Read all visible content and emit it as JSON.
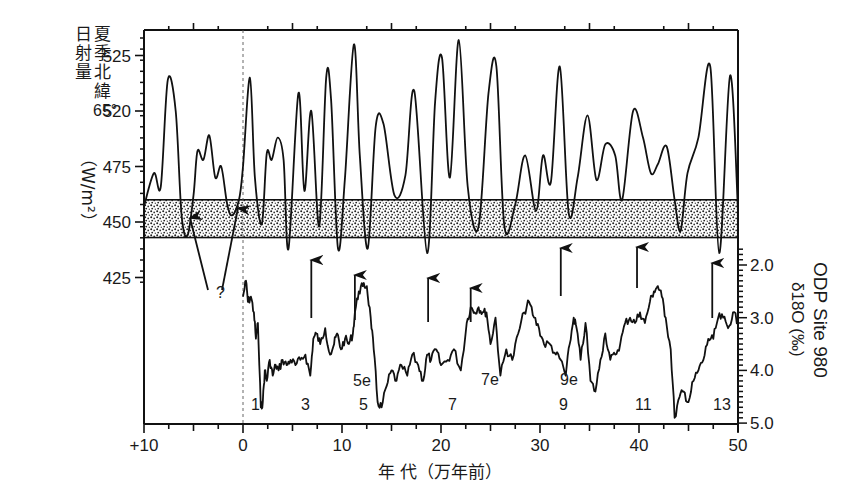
{
  "chart_data": {
    "type": "line",
    "title": "",
    "xlabel": "年 代（万年前）",
    "x_ticks": [
      "+10",
      "0",
      "10",
      "20",
      "30",
      "40",
      "50"
    ],
    "x_tick_values": [
      -10,
      0,
      10,
      20,
      30,
      40,
      50
    ],
    "xlim": [
      -10,
      50
    ],
    "x_reference_line": {
      "x": 0,
      "style": "dashed"
    },
    "top_panel": {
      "series_name": "夏季北緯65°日射量",
      "ylabel_lines": [
        "夏季北緯",
        "日射量",
        "65°",
        "（W/m²）"
      ],
      "y_tick_labels": [
        "525",
        "520",
        "475",
        "450",
        "425"
      ],
      "y_tick_positions": [
        525,
        500,
        475,
        450,
        425
      ],
      "ylim": [
        422,
        560
      ],
      "shaded_band": {
        "y_low": 443,
        "y_high": 460,
        "fill": "stippled"
      },
      "x": [
        -10,
        -9,
        -8.3,
        -7.6,
        -6.8,
        -6.2,
        -5.6,
        -5,
        -4.6,
        -4,
        -3.4,
        -2.8,
        -2.2,
        -1.6,
        -1.1,
        -0.4,
        0,
        0.7,
        1.2,
        1.9,
        2.4,
        2.9,
        3.5,
        4.1,
        4.6,
        5.6,
        6.2,
        6.9,
        7.7,
        8.4,
        8.9,
        9.6,
        10.3,
        11.2,
        11.8,
        12.6,
        13.4,
        14.2,
        15.3,
        16.4,
        17.3,
        18.6,
        19.4,
        20.1,
        20.9,
        21.8,
        22.7,
        23.8,
        24.8,
        25.6,
        26.4,
        27.5,
        28.5,
        29.6,
        30.3,
        31.1,
        32.0,
        32.9,
        33.8,
        34.8,
        35.7,
        36.6,
        37.6,
        38.3,
        39.4,
        40.4,
        41.2,
        41.9,
        42.8,
        43.6,
        44.2,
        44.9,
        46.0,
        47.2,
        48.1,
        49.2,
        50
      ],
      "values": [
        457,
        472,
        466,
        514,
        500,
        453,
        444,
        462,
        482,
        478,
        489,
        470,
        475,
        458,
        453,
        460,
        475,
        515,
        470,
        449,
        481,
        478,
        488,
        478,
        438,
        508,
        464,
        500,
        448,
        515,
        505,
        438,
        470,
        530,
        480,
        438,
        493,
        494,
        462,
        471,
        509,
        436,
        504,
        524,
        470,
        532,
        466,
        448,
        508,
        520,
        448,
        458,
        480,
        455,
        480,
        468,
        520,
        454,
        470,
        498,
        469,
        485,
        480,
        460,
        500,
        488,
        472,
        476,
        484,
        460,
        446,
        472,
        488,
        520,
        436,
        516,
        455
      ]
    },
    "bottom_panel": {
      "series_name": "ODP Site 980 δ18O (‰)",
      "ylabel_lines": [
        "ODP Site 980",
        "δ18O (‰)"
      ],
      "y_tick_labels": [
        "2.0",
        "3.0",
        "4.0",
        "5.0"
      ],
      "y_tick_values": [
        2.0,
        3.0,
        4.0,
        5.0
      ],
      "ylim": [
        1.7,
        5.0
      ],
      "y_inverted": true,
      "x": [
        0,
        0.3,
        0.5,
        0.8,
        1.1,
        1.3,
        1.5,
        1.8,
        2.0,
        2.2,
        2.4,
        2.7,
        3.0,
        3.3,
        3.6,
        4.0,
        4.4,
        4.8,
        5.3,
        5.8,
        6.3,
        6.8,
        7.1,
        7.4,
        7.8,
        8.3,
        8.8,
        9.2,
        9.5,
        9.9,
        10.3,
        10.7,
        11.1,
        11.3,
        11.7,
        12.1,
        12.5,
        12.9,
        13.2,
        13.6,
        14.0,
        14.5,
        15.0,
        15.5,
        16.0,
        16.6,
        17.1,
        17.7,
        18.2,
        18.6,
        19.0,
        19.5,
        20.0,
        20.7,
        21.3,
        22.0,
        22.6,
        23.0,
        23.4,
        23.8,
        24.2,
        24.6,
        25.0,
        25.5,
        26.0,
        26.6,
        27.2,
        27.8,
        28.4,
        28.9,
        29.4,
        29.9,
        30.4,
        31.0,
        31.6,
        32.1,
        32.6,
        33.0,
        33.4,
        33.7,
        34.1,
        34.6,
        35.1,
        35.6,
        36.1,
        36.6,
        37.1,
        37.6,
        38.1,
        38.6,
        39.1,
        39.6,
        40.1,
        40.6,
        41.1,
        41.5,
        41.9,
        42.3,
        42.7,
        43.2,
        43.6,
        44.1,
        44.5,
        45.0,
        45.5,
        46.0,
        46.5,
        47.0,
        47.5,
        48.0,
        48.5,
        49.0,
        49.5,
        50
      ],
      "values": [
        2.6,
        2.3,
        2.7,
        2.6,
        2.9,
        3.4,
        3.1,
        4.7,
        4.6,
        4.0,
        4.2,
        3.8,
        4.1,
        3.9,
        4.0,
        3.8,
        3.9,
        3.8,
        3.9,
        3.8,
        3.7,
        4.1,
        3.4,
        3.3,
        3.5,
        3.2,
        3.7,
        3.5,
        3.3,
        3.6,
        3.4,
        3.5,
        3.3,
        2.9,
        2.5,
        2.4,
        2.4,
        3.0,
        3.6,
        4.6,
        4.7,
        4.3,
        4.0,
        4.2,
        3.9,
        4.1,
        3.7,
        3.9,
        4.2,
        3.7,
        3.8,
        3.6,
        3.9,
        3.8,
        3.6,
        4.0,
        3.1,
        2.8,
        2.9,
        2.8,
        2.9,
        2.9,
        3.5,
        3.0,
        4.1,
        3.6,
        3.8,
        3.3,
        2.9,
        2.7,
        3.0,
        3.2,
        3.5,
        3.5,
        3.7,
        3.8,
        4.1,
        3.5,
        3.0,
        3.2,
        3.8,
        3.1,
        4.2,
        4.4,
        3.8,
        3.3,
        3.8,
        3.7,
        3.5,
        3.1,
        3.0,
        3.1,
        2.9,
        3.1,
        2.7,
        2.5,
        2.4,
        2.6,
        3.0,
        3.6,
        4.9,
        4.5,
        4.4,
        4.6,
        4.2,
        4.0,
        3.8,
        3.4,
        3.4,
        3.0,
        3.0,
        3.2,
        2.9,
        3.1
      ]
    },
    "arrows": [
      {
        "x": -5.6,
        "from_y": 290,
        "to_y": 218,
        "note": "? group"
      },
      {
        "x": -2.2,
        "from_y": 290,
        "to_y": 208,
        "note": "? group"
      },
      {
        "x": 6.9,
        "from_y": 318,
        "to_y": 260
      },
      {
        "x": 11.3,
        "from_y": 320,
        "to_y": 275
      },
      {
        "x": 18.7,
        "from_y": 322,
        "to_y": 278
      },
      {
        "x": 23.0,
        "from_y": 322,
        "to_y": 288
      },
      {
        "x": 32.1,
        "from_y": 296,
        "to_y": 248
      },
      {
        "x": 39.8,
        "from_y": 288,
        "to_y": 247
      },
      {
        "x": 47.4,
        "from_y": 318,
        "to_y": 263
      }
    ],
    "annotations": [
      {
        "text": "?",
        "x_px": 216,
        "y_px": 298
      },
      {
        "text": "1",
        "x_px": 251,
        "y_px": 410
      },
      {
        "text": "3",
        "x_px": 301,
        "y_px": 410
      },
      {
        "text": "5e",
        "x_px": 353,
        "y_px": 386
      },
      {
        "text": "5",
        "x_px": 359,
        "y_px": 410
      },
      {
        "text": "7",
        "x_px": 448,
        "y_px": 410
      },
      {
        "text": "7e",
        "x_px": 481,
        "y_px": 385
      },
      {
        "text": "9e",
        "x_px": 560,
        "y_px": 385
      },
      {
        "text": "9",
        "x_px": 559,
        "y_px": 410
      },
      {
        "text": "11",
        "x_px": 635,
        "y_px": 410
      },
      {
        "text": "13",
        "x_px": 713,
        "y_px": 410
      }
    ]
  },
  "labels": {
    "left_title_col1": [
      "日",
      "射",
      "量"
    ],
    "left_title_col2": [
      "夏",
      "季",
      "北",
      "緯"
    ],
    "left_title_deg": "65°",
    "left_unit": "（W/m²）",
    "right_title": "ODP Site 980",
    "right_unit": "δ18O (‰)",
    "xlabel": "年 代（万年前）"
  }
}
